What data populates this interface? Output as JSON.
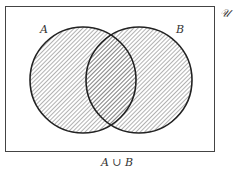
{
  "diagram": {
    "type": "venn",
    "universe_label": "𝒰",
    "set_a_label": "A",
    "set_b_label": "B",
    "caption": "A ∪ B",
    "shaded_region": "union",
    "colors": {
      "stroke": "#222222",
      "hatch": "#555555",
      "background": "#ffffff"
    }
  }
}
